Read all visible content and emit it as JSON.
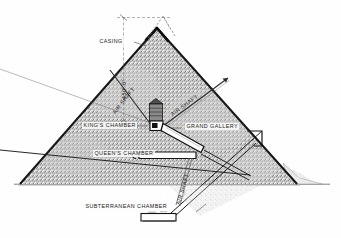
{
  "figure": {
    "type": "architectural-section-diagram",
    "background_color": "#fefefe",
    "masonry_fill_color": "#bdbdbd",
    "outline_color": "#1a1a1a",
    "text_color": "#1b1b1b",
    "ground_line_color": "#4a4a4a"
  },
  "labels": {
    "casing": "CASING",
    "height_dimension": "450'-0\"",
    "air_shaft_left": "AIR SHAFT",
    "air_shaft_right": "AIR SHAFT",
    "air_shaft_lower": "AIR SHAFT",
    "kings_chamber": "KING'S CHAMBER",
    "grand_gallery": "GRAND GALLERY",
    "queens_chamber": "QUEEN'S CHAMBER",
    "subterranean_chamber": "SUBTERRANEAN CHAMBER"
  },
  "annotations": {
    "apex_note": "dashed outline showing original casing apex",
    "dimension_note": "vertical height dimension with tick at apex"
  }
}
